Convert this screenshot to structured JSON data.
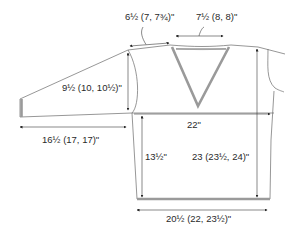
{
  "diagram": {
    "type": "knitting-schematic",
    "measurements": {
      "shoulder_width": "6½ (7, 7¾)\"",
      "neck_width": "7½ (8, 8)\"",
      "armhole_depth": "9½ (10, 10½)\"",
      "chest_width": "22\"",
      "sleeve_length": "16½ (17, 17)\"",
      "length_to_armhole": "13½\"",
      "total_length": "23 (23½, 24)\"",
      "hem_width": "20½ (22, 23½)\""
    }
  }
}
